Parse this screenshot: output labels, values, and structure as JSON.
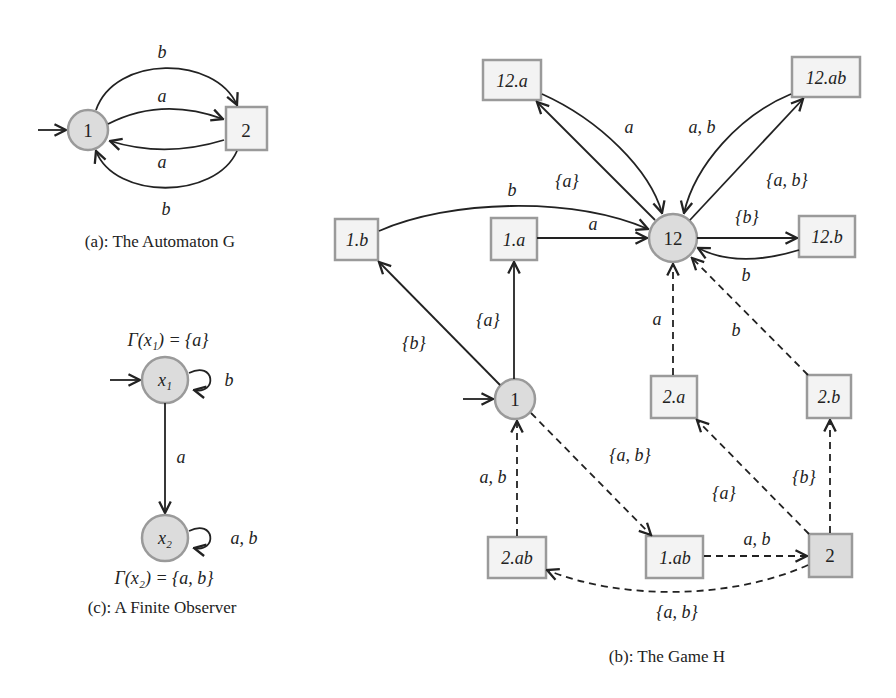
{
  "panel_a": {
    "caption": "(a): The Automaton G",
    "nodes": [
      {
        "id": "1",
        "label": "1",
        "shape": "circle",
        "initial": true
      },
      {
        "id": "2",
        "label": "2",
        "shape": "box"
      }
    ],
    "edges": [
      {
        "from": "1",
        "to": "2",
        "label": "b",
        "style": "solid",
        "curve": "upper-outer"
      },
      {
        "from": "1",
        "to": "2",
        "label": "a",
        "style": "solid",
        "curve": "upper-inner"
      },
      {
        "from": "2",
        "to": "1",
        "label": "a",
        "style": "solid",
        "curve": "lower-inner"
      },
      {
        "from": "2",
        "to": "1",
        "label": "b",
        "style": "solid",
        "curve": "lower-outer"
      }
    ]
  },
  "panel_c": {
    "caption": "(c): A Finite Observer",
    "nodes": [
      {
        "id": "x1",
        "label": "x1",
        "shape": "circle",
        "initial": true,
        "annotation": "Γ(x1) = {a}"
      },
      {
        "id": "x2",
        "label": "x2",
        "shape": "circle",
        "annotation": "Γ(x2) = {a, b}"
      }
    ],
    "edges": [
      {
        "from": "x1",
        "to": "x1",
        "label": "b",
        "style": "self-loop"
      },
      {
        "from": "x1",
        "to": "x2",
        "label": "a",
        "style": "solid"
      },
      {
        "from": "x2",
        "to": "x2",
        "label": "a, b",
        "style": "self-loop"
      }
    ]
  },
  "panel_b": {
    "caption": "(b): The Game H",
    "nodes": [
      {
        "id": "12.a",
        "label": "12.a",
        "shape": "box"
      },
      {
        "id": "12.ab",
        "label": "12.ab",
        "shape": "box"
      },
      {
        "id": "1.b",
        "label": "1.b",
        "shape": "box"
      },
      {
        "id": "1.a",
        "label": "1.a",
        "shape": "box"
      },
      {
        "id": "12",
        "label": "12",
        "shape": "circle"
      },
      {
        "id": "12.b",
        "label": "12.b",
        "shape": "box"
      },
      {
        "id": "1",
        "label": "1",
        "shape": "circle",
        "initial": true
      },
      {
        "id": "2.a",
        "label": "2.a",
        "shape": "box"
      },
      {
        "id": "2.b",
        "label": "2.b",
        "shape": "box"
      },
      {
        "id": "2.ab",
        "label": "2.ab",
        "shape": "box"
      },
      {
        "id": "1.ab",
        "label": "1.ab",
        "shape": "box"
      },
      {
        "id": "2",
        "label": "2",
        "shape": "box-filled"
      }
    ],
    "edges": [
      {
        "from": "1",
        "to": "1.b",
        "label": "{b}",
        "style": "solid"
      },
      {
        "from": "1",
        "to": "1.a",
        "label": "{a}",
        "style": "solid"
      },
      {
        "from": "1.b",
        "to": "12",
        "label": "b",
        "style": "solid"
      },
      {
        "from": "1.a",
        "to": "12",
        "label": "a",
        "style": "solid"
      },
      {
        "from": "12",
        "to": "12.a",
        "label": "{a}",
        "style": "solid"
      },
      {
        "from": "12.a",
        "to": "12",
        "label": "a",
        "style": "solid"
      },
      {
        "from": "12",
        "to": "12.ab",
        "label": "{a, b}",
        "style": "solid"
      },
      {
        "from": "12.ab",
        "to": "12",
        "label": "a, b",
        "style": "solid"
      },
      {
        "from": "12",
        "to": "12.b",
        "label": "{b}",
        "style": "solid"
      },
      {
        "from": "12.b",
        "to": "12",
        "label": "b",
        "style": "solid"
      },
      {
        "from": "2.a",
        "to": "12",
        "label": "a",
        "style": "dashed"
      },
      {
        "from": "2.b",
        "to": "12",
        "label": "b",
        "style": "dashed"
      },
      {
        "from": "1",
        "to": "1.ab",
        "label": "{a, b}",
        "style": "dashed"
      },
      {
        "from": "1.ab",
        "to": "2",
        "label": "a, b",
        "style": "dashed"
      },
      {
        "from": "2",
        "to": "2.a",
        "label": "{a}",
        "style": "dashed"
      },
      {
        "from": "2",
        "to": "2.b",
        "label": "{b}",
        "style": "dashed"
      },
      {
        "from": "2",
        "to": "2.ab",
        "label": "{a, b}",
        "style": "dashed"
      },
      {
        "from": "2.ab",
        "to": "1",
        "label": "a, b",
        "style": "dashed"
      }
    ]
  },
  "labels": {
    "a_b_top": "b",
    "a_a_top": "a",
    "a_a_bottom": "a",
    "a_b_bottom": "b",
    "c_gamma1": "Γ(x₁) = {a}",
    "c_gamma2": "Γ(x₂) = {a, b}",
    "c_x1": "x₁",
    "c_x2": "x₂",
    "c_loop1": "b",
    "c_edge": "a",
    "c_loop2": "a, b",
    "b_12a": "12.a",
    "b_12ab": "12.ab",
    "b_1b": "1.b",
    "b_1a": "1.a",
    "b_12": "12",
    "b_12b": "12.b",
    "b_1": "1",
    "b_2a": "2.a",
    "b_2b": "2.b",
    "b_2ab": "2.ab",
    "b_1ab": "1.ab",
    "b_2": "2",
    "e_12a_in": "a",
    "e_12ab_in": "a, b",
    "e_12a_out": "{a}",
    "e_12ab_out": "{a, b}",
    "e_1b_12": "b",
    "e_1a_12": "a",
    "e_12_12b": "{b}",
    "e_12b_12": "b",
    "e_1_1b": "{b}",
    "e_1_1a": "{a}",
    "e_2a_12": "a",
    "e_2b_12": "b",
    "e_1_1ab": "{a, b}",
    "e_2ab_1": "a, b",
    "e_2_2a": "{a}",
    "e_2_2b": "{b}",
    "e_1ab_2": "a, b",
    "e_2_2ab": "{a, b}"
  },
  "colors": {
    "node_fill": "#dcdcdc",
    "box_fill": "#f3f3f3",
    "node_stroke": "#9a9a9a",
    "edge": "#222222"
  }
}
